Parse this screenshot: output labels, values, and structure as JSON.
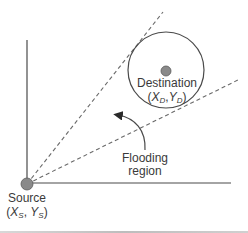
{
  "diagram": {
    "type": "flooding-region-geometry",
    "colors": {
      "line": "#4a4a4a",
      "dashed": "#6a6a6a",
      "node_fill": "#8a8a8a",
      "node_stroke": "#5a5a5a",
      "text": "#3a3a3a",
      "background": "#ffffff"
    },
    "source": {
      "label": "Source",
      "coord_x": "X",
      "coord_x_sub": "S",
      "coord_y": "Y",
      "coord_y_sub": "S",
      "cx": 27,
      "cy": 184,
      "r": 6
    },
    "destination": {
      "label": "Destination",
      "coord_x": "X",
      "coord_x_sub": "D",
      "coord_y": "Y",
      "coord_y_sub": "D",
      "cx": 166,
      "cy": 71,
      "r": 5,
      "region_cx": 166,
      "region_cy": 70,
      "region_r": 38
    },
    "axes": {
      "origin": [
        27,
        183
      ],
      "y_end": [
        27,
        40
      ],
      "x_end": [
        231,
        183
      ]
    },
    "tangent_lines": [
      {
        "name": "upper-tangent",
        "from": [
          27,
          184
        ],
        "to": [
          163,
          12
        ]
      },
      {
        "name": "lower-tangent",
        "from": [
          27,
          184
        ],
        "to": [
          238,
          80
        ]
      }
    ],
    "annotation": {
      "label_line1": "Flooding",
      "label_line2": "region"
    }
  }
}
